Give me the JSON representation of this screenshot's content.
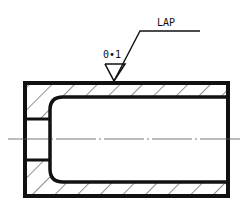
{
  "surface_symbol": {
    "roughness_value": "0•1",
    "process_label": "LAP"
  },
  "colors": {
    "line": "#111111",
    "background": "#ffffff",
    "centerline": "#555555"
  }
}
